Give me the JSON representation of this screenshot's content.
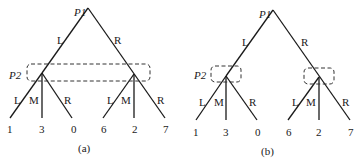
{
  "panels": [
    {
      "caption": "(a)",
      "root_player": "P1",
      "info_player": "P2",
      "info_set": "single set spanning both P2 nodes",
      "root_edges": [
        "L",
        "R"
      ],
      "left_edges": [
        "L",
        "M",
        "R"
      ],
      "right_edges": [
        "L",
        "M",
        "R"
      ],
      "payoffs": [
        "1",
        "3",
        "0",
        "6",
        "2",
        "7"
      ]
    },
    {
      "caption": "(b)",
      "root_player": "P1",
      "info_player": "P2",
      "info_set": "separate set around each P2 node",
      "root_edges": [
        "L",
        "R"
      ],
      "left_edges": [
        "L",
        "M",
        "R"
      ],
      "right_edges": [
        "L",
        "M",
        "R"
      ],
      "payoffs": [
        "1",
        "3",
        "0",
        "6",
        "2",
        "7"
      ]
    }
  ]
}
